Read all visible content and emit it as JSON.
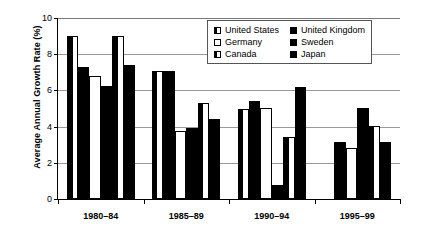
{
  "chart_data": {
    "type": "bar",
    "title": "",
    "xlabel": "",
    "ylabel": "Average Annual Growth Rate (%)",
    "ylim": [
      0,
      10
    ],
    "ytick_labels": [
      "0",
      "2",
      "4",
      "6",
      "8",
      "10"
    ],
    "ytick_values": [
      0,
      2,
      4,
      6,
      8,
      10
    ],
    "grid": true,
    "legend_position": "top-right",
    "categories": [
      "1980–84",
      "1985–89",
      "1990–94",
      "1995–99"
    ],
    "series": [
      {
        "name": "United States",
        "pattern": "half",
        "values": [
          9.0,
          7.1,
          4.95,
          0.0
        ]
      },
      {
        "name": "United Kingdom",
        "pattern": "solid",
        "values": [
          7.3,
          7.1,
          5.4,
          3.15
        ]
      },
      {
        "name": "Germany",
        "pattern": "hollow",
        "values": [
          6.8,
          3.75,
          5.05,
          2.8
        ]
      },
      {
        "name": "Sweden",
        "pattern": "solid",
        "values": [
          6.25,
          3.95,
          0.8,
          5.05
        ]
      },
      {
        "name": "Canada",
        "pattern": "half",
        "values": [
          9.0,
          5.3,
          3.45,
          4.05
        ]
      },
      {
        "name": "Japan",
        "pattern": "solid",
        "values": [
          7.4,
          4.4,
          6.2,
          3.15
        ]
      }
    ]
  },
  "legend": {
    "items": [
      {
        "label": "United States",
        "pattern": "half"
      },
      {
        "label": "United Kingdom",
        "pattern": "solid"
      },
      {
        "label": "Germany",
        "pattern": "hollow"
      },
      {
        "label": "Sweden",
        "pattern": "solid"
      },
      {
        "label": "Canada",
        "pattern": "half"
      },
      {
        "label": "Japan",
        "pattern": "solid"
      }
    ]
  },
  "colors": {
    "fill": "#000000",
    "empty": "#ffffff",
    "axis": "#000000",
    "grid": "#999999"
  }
}
